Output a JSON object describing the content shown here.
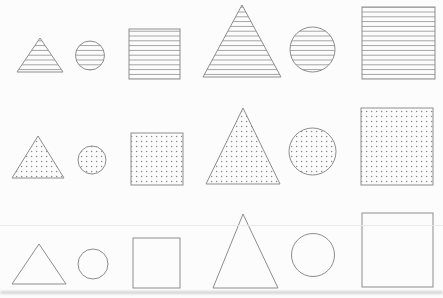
{
  "canvas": {
    "width": 443,
    "height": 298,
    "background": "#fcfcfc"
  },
  "palette": {
    "outline": "#8d8d8d",
    "stripe": "#8d8d8d",
    "dot": "#8a8a8a",
    "artifact_line": "#e7e7e7",
    "bottom_band": "#c9c9c9"
  },
  "pattern_metrics": {
    "stripe_spacing_px": 4.8,
    "stripe_width_px": 0.8,
    "dot_spacing_px": 5,
    "dot_radius_px": 0.75
  },
  "grid": {
    "description": "3x6 matrix of outlined shapes; rows differ by fill pattern (horizontal stripes, dots, plain), columns alternate small/large triangle, circle, square",
    "rows": [
      {
        "name": "striped",
        "fill": "hlines",
        "shapes": [
          {
            "kind": "triangle",
            "size": "small",
            "points": [
              [
                40,
                38
              ],
              [
                17,
                72
              ],
              [
                63,
                72
              ]
            ]
          },
          {
            "kind": "circle",
            "size": "small",
            "cx": 90,
            "cy": 55.5,
            "r": 14.5
          },
          {
            "kind": "square",
            "size": "small",
            "x": 129,
            "y": 29,
            "w": 51,
            "h": 50
          },
          {
            "kind": "triangle",
            "size": "large",
            "points": [
              [
                242,
                5
              ],
              [
                203,
                77
              ],
              [
                281,
                77
              ]
            ]
          },
          {
            "kind": "circle",
            "size": "large",
            "cx": 312.5,
            "cy": 49.5,
            "r": 22.5
          },
          {
            "kind": "square",
            "size": "large",
            "x": 362,
            "y": 7,
            "w": 73,
            "h": 72
          }
        ]
      },
      {
        "name": "dotted",
        "fill": "dots",
        "shapes": [
          {
            "kind": "triangle",
            "size": "small",
            "points": [
              [
                38,
                136
              ],
              [
                12,
                178
              ],
              [
                64,
                178
              ]
            ]
          },
          {
            "kind": "circle",
            "size": "small",
            "cx": 92,
            "cy": 160,
            "r": 14
          },
          {
            "kind": "square",
            "size": "small",
            "x": 131,
            "y": 133,
            "w": 52,
            "h": 52
          },
          {
            "kind": "triangle",
            "size": "large",
            "points": [
              [
                243,
                108
              ],
              [
                206,
                184
              ],
              [
                280,
                184
              ]
            ]
          },
          {
            "kind": "circle",
            "size": "large",
            "cx": 312.5,
            "cy": 151.5,
            "r": 23.5
          },
          {
            "kind": "square",
            "size": "large",
            "x": 361,
            "y": 108,
            "w": 72,
            "h": 77
          }
        ]
      },
      {
        "name": "plain",
        "fill": "none",
        "shapes": [
          {
            "kind": "triangle",
            "size": "small",
            "points": [
              [
                39,
                244
              ],
              [
                12,
                284
              ],
              [
                66,
                284
              ]
            ]
          },
          {
            "kind": "circle",
            "size": "small",
            "cx": 93,
            "cy": 264,
            "r": 15
          },
          {
            "kind": "square",
            "size": "small",
            "x": 133,
            "y": 238,
            "w": 47,
            "h": 50
          },
          {
            "kind": "triangle",
            "size": "large",
            "points": [
              [
                243,
                214
              ],
              [
                213,
                288
              ],
              [
                278,
                288
              ]
            ]
          },
          {
            "kind": "circle",
            "size": "large",
            "cx": 313,
            "cy": 255,
            "r": 21.5
          },
          {
            "kind": "square",
            "size": "large",
            "x": 362,
            "y": 213,
            "w": 71,
            "h": 74
          }
        ]
      }
    ]
  },
  "artifacts": {
    "faint_line_y": 225,
    "bottom_band_y": 291
  }
}
